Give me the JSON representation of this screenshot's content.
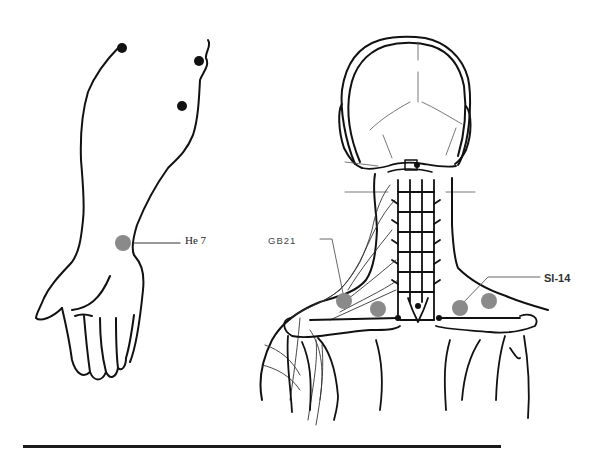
{
  "figure": {
    "panels": [
      {
        "name": "forearm-and-hand",
        "view": "anterior arm with wrist point"
      },
      {
        "name": "head-neck-shoulders",
        "view": "posterior view of skull, cervical spine and shoulders"
      }
    ],
    "acupoints": [
      {
        "id": "He7",
        "label": "He 7",
        "x": 123,
        "y": 243,
        "color": "#8a8a8a"
      },
      {
        "id": "GB21",
        "label": "GB21",
        "x": 344,
        "y": 301,
        "color": "#8a8a8a"
      },
      {
        "id": "GB21b",
        "label": "",
        "x": 378,
        "y": 309,
        "color": "#8a8a8a"
      },
      {
        "id": "SI14",
        "label": "SI-14",
        "x": 460,
        "y": 308,
        "color": "#8a8a8a"
      },
      {
        "id": "SI14b",
        "label": "",
        "x": 489,
        "y": 301,
        "color": "#8a8a8a"
      }
    ],
    "black_points": [
      {
        "x": 122,
        "y": 48
      },
      {
        "x": 199,
        "y": 61
      },
      {
        "x": 182,
        "y": 106
      }
    ],
    "labels": {
      "he7": "He 7",
      "gb21": "GB21",
      "si14": "SI-14"
    },
    "colors": {
      "ink": "#111111",
      "point_gray": "#8a8a8a",
      "background": "#ffffff"
    }
  }
}
